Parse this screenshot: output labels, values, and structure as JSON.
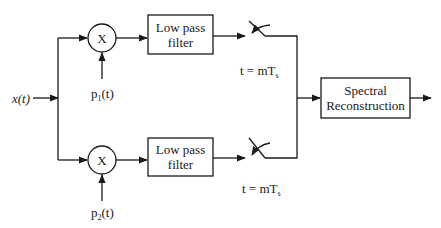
{
  "diagram": {
    "title": "",
    "input": {
      "label": "x(t)"
    },
    "branches": [
      {
        "multiplier": {
          "symbol": "X"
        },
        "modulating_signal": {
          "base": "p",
          "subscript": "1",
          "suffix": "(t)"
        },
        "filter": {
          "line1": "Low pass",
          "line2": "filter"
        },
        "sampler": {
          "label_prefix": "t = mT",
          "label_subscript": "s"
        }
      },
      {
        "multiplier": {
          "symbol": "X"
        },
        "modulating_signal": {
          "base": "p",
          "subscript": "2",
          "suffix": "(t)"
        },
        "filter": {
          "line1": "Low pass",
          "line2": "filter"
        },
        "sampler": {
          "label_prefix": "t = mT",
          "label_subscript": "s"
        }
      }
    ],
    "reconstruction": {
      "line1": "Spectral",
      "line2": "Reconstruction"
    },
    "colors": {
      "line": "#1a1a1a",
      "background": "#ffffff"
    }
  }
}
